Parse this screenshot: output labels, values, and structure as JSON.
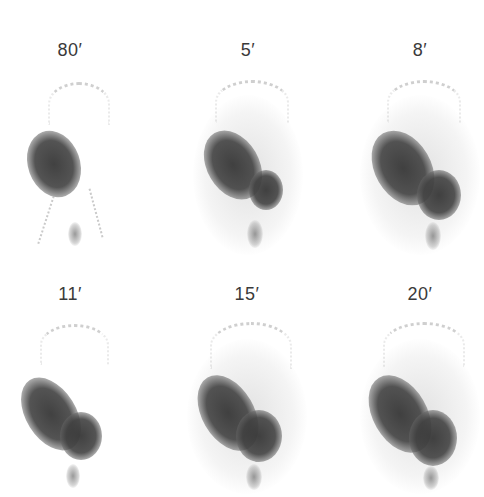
{
  "figure": {
    "panels": [
      {
        "label": "80′",
        "row": 1,
        "col": 1
      },
      {
        "label": "5′",
        "row": 1,
        "col": 2
      },
      {
        "label": "8′",
        "row": 1,
        "col": 3
      },
      {
        "label": "11′",
        "row": 2,
        "col": 1
      },
      {
        "label": "15′",
        "row": 2,
        "col": 2
      },
      {
        "label": "20′",
        "row": 2,
        "col": 3
      }
    ]
  }
}
